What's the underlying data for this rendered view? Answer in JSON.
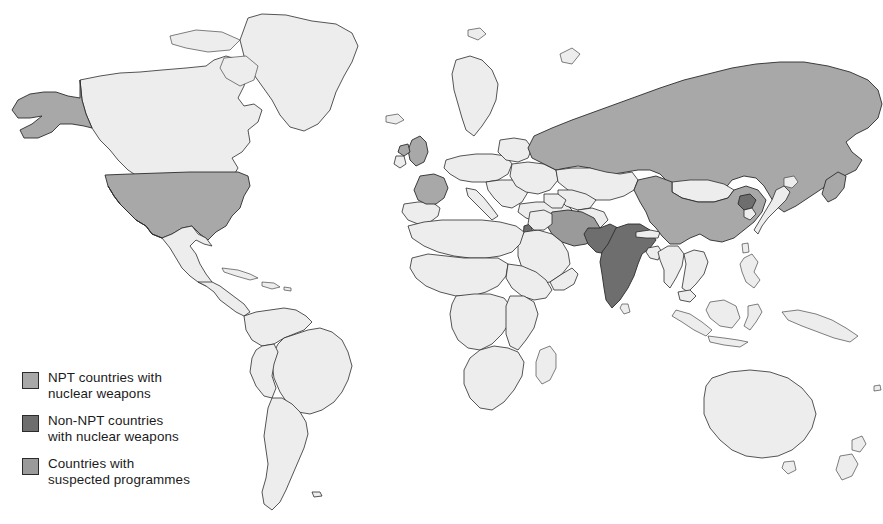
{
  "map": {
    "title": "World map of nuclear weapons states",
    "background_color": "#ffffff",
    "unshaded_country_color": "#ededed",
    "border_color": "#2b2b2b",
    "categories": {
      "npt_nuclear": {
        "label": "NPT countries with nuclear weapons",
        "color": "#a8a8a8",
        "countries": [
          "United States",
          "Russia",
          "China",
          "United Kingdom",
          "France"
        ]
      },
      "non_npt_nuclear": {
        "label": "Non-NPT countries with nuclear weapons",
        "color": "#6e6e6e",
        "countries": [
          "India",
          "Pakistan",
          "Israel",
          "North Korea"
        ]
      },
      "suspected": {
        "label": "Countries with suspected programmes",
        "color": "#9a9a9a",
        "countries": [
          "Iran"
        ]
      }
    }
  },
  "legend": {
    "items": [
      {
        "swatch_color": "#a8a8a8",
        "label": "NPT countries with\nnuclear weapons",
        "icon": "legend-swatch-light"
      },
      {
        "swatch_color": "#6e6e6e",
        "label": "Non-NPT countries\nwith nuclear weapons",
        "icon": "legend-swatch-dark"
      },
      {
        "swatch_color": "#9a9a9a",
        "label": "Countries with\nsuspected programmes",
        "icon": "legend-swatch-medium"
      }
    ]
  }
}
